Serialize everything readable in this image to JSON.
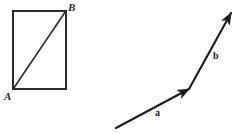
{
  "figure": {
    "background_color": "#ffffff",
    "stroke_color": "#2b2b2b",
    "width": 232,
    "height": 134
  },
  "left_figure": {
    "name": "rectangle-with-diagonal",
    "shape": "rectangle",
    "rect": {
      "x": 13,
      "y": 11,
      "width": 53,
      "height": 78
    },
    "diagonal": {
      "from": "A",
      "to": "B"
    },
    "labels": {
      "bottom_left": "A",
      "top_right": "B"
    }
  },
  "right_figure": {
    "name": "vector-chain",
    "vectors": [
      {
        "label": "a",
        "start": {
          "x": 116,
          "y": 128
        },
        "end": {
          "x": 189,
          "y": 89
        },
        "has_arrowhead": true
      },
      {
        "label": "b",
        "start": {
          "x": 189,
          "y": 89
        },
        "end": {
          "x": 231,
          "y": 13
        },
        "has_arrowhead": true
      }
    ],
    "labels": {
      "vector_a": "a",
      "vector_b": "b"
    }
  }
}
